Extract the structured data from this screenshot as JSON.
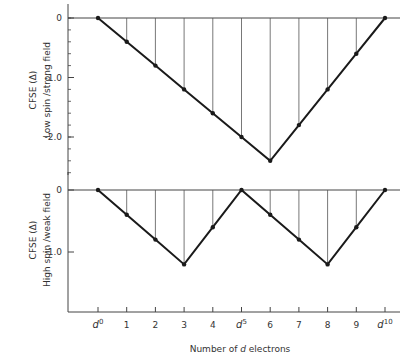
{
  "chart_data": [
    {
      "type": "line",
      "panel": "top",
      "ylabel_line1": "CFSE (Δ)",
      "ylabel_line2": "Low spin /strong field",
      "x": [
        0,
        1,
        2,
        3,
        4,
        5,
        6,
        7,
        8,
        9,
        10
      ],
      "values": [
        0,
        -0.4,
        -0.8,
        -1.2,
        -1.6,
        -2.0,
        -2.4,
        -1.8,
        -1.2,
        -0.6,
        0
      ],
      "yticks": [
        {
          "value": 0,
          "label": "0"
        },
        {
          "value": -1.0,
          "label": "-1.0"
        },
        {
          "value": -2.0,
          "label": "-2.0"
        }
      ],
      "ylim": [
        -2.6,
        0.3
      ],
      "drop_lines": true
    },
    {
      "type": "line",
      "panel": "bottom",
      "ylabel_line1": "CFSE (Δ)",
      "ylabel_line2": "High spin /weak field",
      "x": [
        0,
        1,
        2,
        3,
        4,
        5,
        6,
        7,
        8,
        9,
        10
      ],
      "values": [
        0,
        -0.4,
        -0.8,
        -1.2,
        -0.6,
        0,
        -0.4,
        -0.8,
        -1.2,
        -0.6,
        0
      ],
      "yticks": [
        {
          "value": 0,
          "label": "0"
        },
        {
          "value": -1.0,
          "label": "-1.0"
        }
      ],
      "ylim": [
        -2.0,
        0.25
      ],
      "drop_lines": true
    }
  ],
  "x_axis": {
    "title_prefix": "Number of ",
    "title_d": "d",
    "title_suffix": " electrons",
    "ticks": [
      {
        "base": "d",
        "sup": "0"
      },
      {
        "base": "1",
        "sup": ""
      },
      {
        "base": "2",
        "sup": ""
      },
      {
        "base": "3",
        "sup": ""
      },
      {
        "base": "4",
        "sup": ""
      },
      {
        "base": "d",
        "sup": "5"
      },
      {
        "base": "6",
        "sup": ""
      },
      {
        "base": "7",
        "sup": ""
      },
      {
        "base": "8",
        "sup": ""
      },
      {
        "base": "9",
        "sup": ""
      },
      {
        "base": "d",
        "sup": "10"
      }
    ]
  },
  "colors": {
    "line": "#1a1a1a",
    "axis": "#444444",
    "drop": "#555555"
  }
}
